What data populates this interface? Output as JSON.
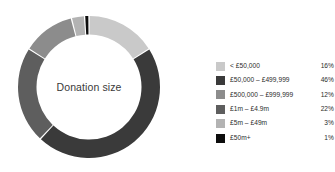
{
  "chart_data": {
    "type": "pie",
    "variant": "donut",
    "title": "Donation size",
    "center_label": "Donation size",
    "xlabel": "",
    "ylabel": "",
    "grid": false,
    "legend_position": "right",
    "start_angle_deg": 0,
    "direction": "clockwise",
    "units": "%",
    "categories": [
      "< £50,000",
      "£50,000 – £499,999",
      "£500,000 – £999,999",
      "£1m – £4.9m",
      "£5m – £49m",
      "£50m+"
    ],
    "values": [
      16,
      46,
      12,
      22,
      3,
      1
    ],
    "value_labels": [
      "16%",
      "46%",
      "12%",
      "22%",
      "3%",
      "1%"
    ],
    "colors": [
      "#c9c9c9",
      "#3a3a3a",
      "#8c8c8c",
      "#5e5e5e",
      "#b3b3b3",
      "#0d0d0d"
    ],
    "slices": [
      {
        "label": "< £50,000",
        "value": 16,
        "value_label": "16%",
        "color": "#c9c9c9",
        "order": 1
      },
      {
        "label": "£50,000 – £499,999",
        "value": 46,
        "value_label": "46%",
        "color": "#3a3a3a",
        "order": 2
      },
      {
        "label": "£500,000 – £999,999",
        "value": 12,
        "value_label": "12%",
        "color": "#8c8c8c",
        "order": 3
      },
      {
        "label": "£1m – £4.9m",
        "value": 22,
        "value_label": "22%",
        "color": "#5e5e5e",
        "order": 4
      },
      {
        "label": "£5m – £49m",
        "value": 3,
        "value_label": "3%",
        "color": "#b3b3b3",
        "order": 5
      },
      {
        "label": "£50m+",
        "value": 1,
        "value_label": "1%",
        "color": "#0d0d0d",
        "order": 6
      }
    ],
    "draw_order_clockwise": [
      {
        "label": "< £50,000",
        "value": 16,
        "color": "#c9c9c9"
      },
      {
        "label": "£50,000 – £499,999",
        "value": 46,
        "color": "#3a3a3a"
      },
      {
        "label": "£1m – £4.9m",
        "value": 22,
        "color": "#5e5e5e"
      },
      {
        "label": "£500,000 – £999,999",
        "value": 12,
        "color": "#8c8c8c"
      },
      {
        "label": "£5m – £49m",
        "value": 3,
        "color": "#b3b3b3"
      },
      {
        "label": "£50m+",
        "value": 1,
        "color": "#0d0d0d"
      }
    ]
  },
  "legend": {
    "rows": [
      {
        "label": "< £50,000",
        "pct": "16%",
        "color": "#c9c9c9"
      },
      {
        "label": "£50,000 – £499,999",
        "pct": "46%",
        "color": "#3a3a3a"
      },
      {
        "label": "£500,000 – £999,999",
        "pct": "12%",
        "color": "#8c8c8c"
      },
      {
        "label": "£1m – £4.9m",
        "pct": "22%",
        "color": "#5e5e5e"
      },
      {
        "label": "£5m – £49m",
        "pct": "3%",
        "color": "#b3b3b3"
      },
      {
        "label": "£50m+",
        "pct": "1%",
        "color": "#0d0d0d"
      }
    ]
  },
  "theme": {
    "background": "#ffffff",
    "text": "#2b2b2b",
    "center_text": "#3a3a3a"
  }
}
